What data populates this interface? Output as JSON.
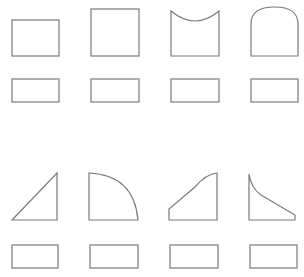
{
  "canvas": {
    "width": 304,
    "height": 277,
    "background": "#ffffff",
    "stroke": "#7a7a7a"
  },
  "rows": [
    {
      "shapes": [
        {
          "name": "rectangle",
          "label": ""
        },
        {
          "name": "square",
          "label": ""
        },
        {
          "name": "square-with-concave-top",
          "label": ""
        },
        {
          "name": "square-with-arched-top",
          "label": ""
        }
      ]
    },
    {
      "shapes": [
        {
          "name": "right-triangle",
          "label": ""
        },
        {
          "name": "quarter-circle",
          "label": ""
        },
        {
          "name": "trapezoid-with-curved-top",
          "label": ""
        },
        {
          "name": "trapezoid-with-concave-slope",
          "label": ""
        }
      ]
    }
  ]
}
